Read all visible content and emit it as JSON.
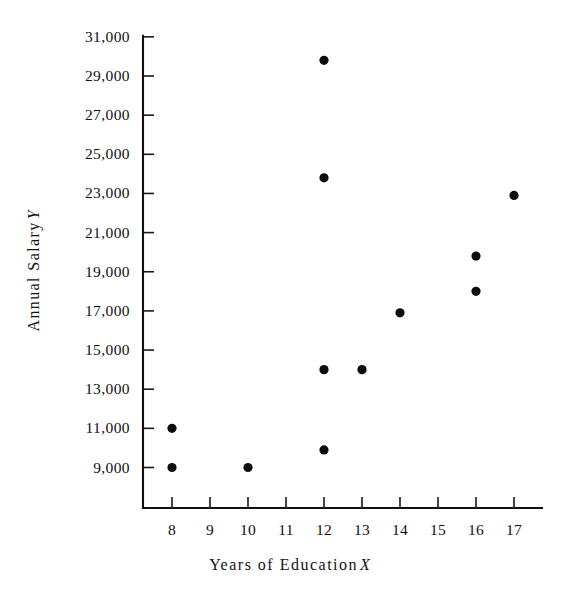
{
  "chart_data": {
    "type": "scatter",
    "title": "",
    "xlabel": "Years of Education X",
    "xlabel_text": "Years of Education",
    "xlabel_var": "X",
    "ylabel": "Annual Salary Y",
    "ylabel_text": "Annual Salary",
    "ylabel_var": "Y",
    "xlim": [
      7.4,
      17.8
    ],
    "ylim": [
      8100,
      31600
    ],
    "grid": false,
    "legend": null,
    "marker": "filled-circle",
    "marker_color": "#0d0d0d",
    "xticks": [
      8,
      9,
      10,
      11,
      12,
      13,
      14,
      15,
      16,
      17
    ],
    "xtick_labels": [
      "8",
      "9",
      "10",
      "11",
      "12",
      "13",
      "14",
      "15",
      "16",
      "17"
    ],
    "yticks": [
      9000,
      11000,
      13000,
      15000,
      17000,
      19000,
      21000,
      23000,
      25000,
      27000,
      29000,
      31000
    ],
    "ytick_labels": [
      "9,000",
      "11,000",
      "13,000",
      "15,000",
      "17,000",
      "19,000",
      "21,000",
      "23,000",
      "25,000",
      "27,000",
      "29,000",
      "31,000"
    ],
    "x": [
      8,
      8,
      10,
      12,
      12,
      12,
      12,
      13,
      14,
      16,
      16,
      17
    ],
    "y": [
      11000,
      9000,
      9000,
      9900,
      14000,
      23800,
      29800,
      14000,
      16900,
      18000,
      19800,
      22900
    ],
    "points": [
      {
        "x": 8,
        "y": 11000
      },
      {
        "x": 8,
        "y": 9000
      },
      {
        "x": 10,
        "y": 9000
      },
      {
        "x": 12,
        "y": 9900
      },
      {
        "x": 12,
        "y": 14000
      },
      {
        "x": 12,
        "y": 23800
      },
      {
        "x": 12,
        "y": 29800
      },
      {
        "x": 13,
        "y": 14000
      },
      {
        "x": 14,
        "y": 16900
      },
      {
        "x": 16,
        "y": 18000
      },
      {
        "x": 16,
        "y": 19800
      },
      {
        "x": 17,
        "y": 22900
      }
    ]
  },
  "style": {
    "background": "#ffffff",
    "axis_color": "#111111",
    "text_color": "#111111",
    "marker_radius_px": 4.6
  }
}
